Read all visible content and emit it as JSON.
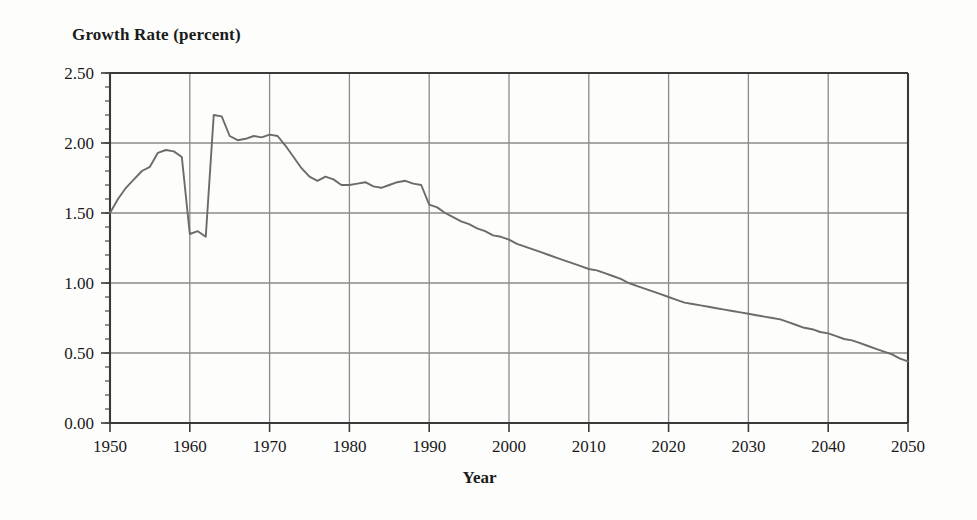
{
  "chart_data": {
    "type": "line",
    "title": "Growth Rate (percent)",
    "xlabel": "Year",
    "ylabel": "Growth Rate (percent)",
    "xlim": [
      1950,
      2050
    ],
    "ylim": [
      0.0,
      2.5
    ],
    "grid": true,
    "legend": "none",
    "x_ticks": [
      "1950",
      "1960",
      "1970",
      "1980",
      "1990",
      "2000",
      "2010",
      "2020",
      "2030",
      "2040",
      "2050"
    ],
    "y_ticks": [
      "0.00",
      "0.50",
      "1.00",
      "1.50",
      "2.00",
      "2.50"
    ],
    "x_tick_values": [
      1950,
      1960,
      1970,
      1980,
      1990,
      2000,
      2010,
      2020,
      2030,
      2040,
      2050
    ],
    "y_tick_values": [
      0.0,
      0.5,
      1.0,
      1.5,
      2.0,
      2.5
    ],
    "y_minor_step": 0.1,
    "line_color": "#6b6b6b",
    "axis_color": "#3a3a3a",
    "grid_color": "#8a8a8a",
    "series": [
      {
        "name": "Growth Rate",
        "x": [
          1950,
          1951,
          1952,
          1953,
          1954,
          1955,
          1956,
          1957,
          1958,
          1959,
          1960,
          1961,
          1962,
          1963,
          1964,
          1965,
          1966,
          1967,
          1968,
          1969,
          1970,
          1971,
          1972,
          1973,
          1974,
          1975,
          1976,
          1977,
          1978,
          1979,
          1980,
          1981,
          1982,
          1983,
          1984,
          1985,
          1986,
          1987,
          1988,
          1989,
          1990,
          1991,
          1992,
          1993,
          1994,
          1995,
          1996,
          1997,
          1998,
          1999,
          2000,
          2001,
          2002,
          2003,
          2004,
          2005,
          2006,
          2007,
          2008,
          2009,
          2010,
          2011,
          2012,
          2013,
          2014,
          2015,
          2016,
          2017,
          2018,
          2019,
          2020,
          2021,
          2022,
          2023,
          2024,
          2025,
          2026,
          2027,
          2028,
          2029,
          2030,
          2031,
          2032,
          2033,
          2034,
          2035,
          2036,
          2037,
          2038,
          2039,
          2040,
          2041,
          2042,
          2043,
          2044,
          2045,
          2046,
          2047,
          2048,
          2049,
          2050
        ],
        "y": [
          1.5,
          1.6,
          1.68,
          1.74,
          1.8,
          1.83,
          1.93,
          1.95,
          1.94,
          1.9,
          1.35,
          1.37,
          1.33,
          2.2,
          2.19,
          2.05,
          2.02,
          2.03,
          2.05,
          2.04,
          2.06,
          2.05,
          1.98,
          1.9,
          1.82,
          1.76,
          1.73,
          1.76,
          1.74,
          1.7,
          1.7,
          1.71,
          1.72,
          1.69,
          1.68,
          1.7,
          1.72,
          1.73,
          1.71,
          1.7,
          1.56,
          1.54,
          1.5,
          1.47,
          1.44,
          1.42,
          1.39,
          1.37,
          1.34,
          1.33,
          1.31,
          1.28,
          1.26,
          1.24,
          1.22,
          1.2,
          1.18,
          1.16,
          1.14,
          1.12,
          1.1,
          1.09,
          1.07,
          1.05,
          1.03,
          1.0,
          0.98,
          0.96,
          0.94,
          0.92,
          0.9,
          0.88,
          0.86,
          0.85,
          0.84,
          0.83,
          0.82,
          0.81,
          0.8,
          0.79,
          0.78,
          0.77,
          0.76,
          0.75,
          0.74,
          0.72,
          0.7,
          0.68,
          0.67,
          0.65,
          0.64,
          0.62,
          0.6,
          0.59,
          0.57,
          0.55,
          0.53,
          0.51,
          0.49,
          0.46,
          0.44
        ]
      }
    ]
  }
}
